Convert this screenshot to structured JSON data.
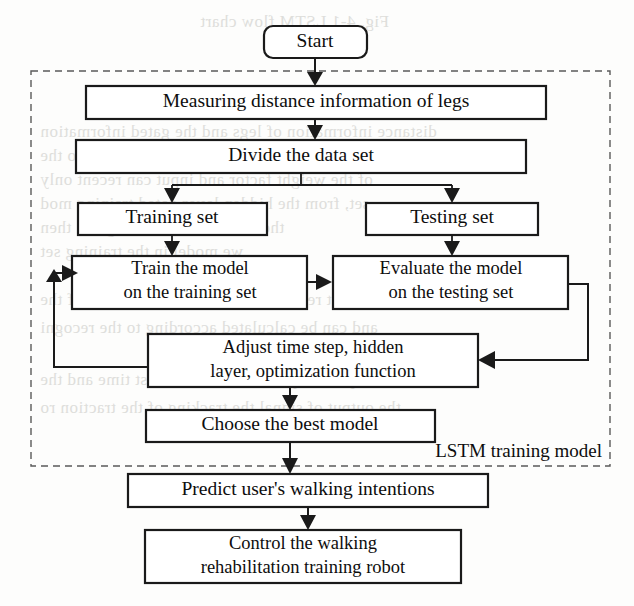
{
  "figure": {
    "type": "flowchart",
    "background_color": "#fdfdfc",
    "line_color": "#1a1a1a",
    "group_border_color": "#5a5a5a",
    "group_border_style": "dashed"
  },
  "nodes": {
    "start": {
      "label": "Start",
      "shape": "rounded-rect"
    },
    "measure": {
      "label": "Measuring distance information of legs",
      "shape": "rect"
    },
    "divide": {
      "label": "Divide the data set",
      "shape": "rect"
    },
    "training_set": {
      "label": "Training set",
      "shape": "rect"
    },
    "testing_set": {
      "label": "Testing set",
      "shape": "rect"
    },
    "train_model": {
      "label_line1": "Train the model",
      "label_line2": "on the training set",
      "shape": "rect"
    },
    "evaluate_model": {
      "label_line1": "Evaluate the model",
      "label_line2": "on the testing set",
      "shape": "rect"
    },
    "adjust": {
      "label_line1": "Adjust time step, hidden",
      "label_line2": "layer, optimization function",
      "shape": "rect"
    },
    "choose_best": {
      "label": "Choose the best model",
      "shape": "rect"
    },
    "predict": {
      "label": "Predict user's walking intentions",
      "shape": "rect"
    },
    "control": {
      "label_line1": "Control the walking",
      "label_line2": "rehabilitation training robot",
      "shape": "rect"
    }
  },
  "group": {
    "label": "LSTM training model"
  },
  "bleed_text": [
    {
      "text": "Fig. 4-1 LSTM flow chart",
      "x": 200,
      "y": 12
    },
    {
      "text": "distance information of legs and the gated information",
      "x": 40,
      "y": 122
    },
    {
      "text": "LSTM the model to use to the speak to the",
      "x": 40,
      "y": 146
    },
    {
      "text": "of the weight factor and input can recent only",
      "x": 40,
      "y": 170
    },
    {
      "text": "set, from the hidden layer gated training mod",
      "x": 40,
      "y": 194
    },
    {
      "text": "the results on the testing set, then",
      "x": 40,
      "y": 218
    },
    {
      "text": "we model in the training set",
      "x": 40,
      "y": 242
    },
    {
      "text": "the test result is summed of the distance of the",
      "x": 40,
      "y": 290
    },
    {
      "text": "and can be calculated according to the recogni",
      "x": 40,
      "y": 318
    },
    {
      "text": "robot speed required to reach the last time and the",
      "x": 40,
      "y": 370
    },
    {
      "text": "the output of signal the tracking of the traction ro",
      "x": 40,
      "y": 398
    }
  ]
}
